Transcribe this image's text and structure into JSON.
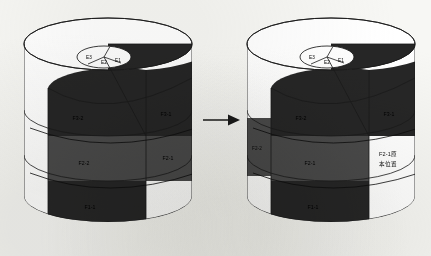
{
  "figure": {
    "background_color": "#f7f7f4",
    "transition_icon": "right-arrow-icon",
    "colors": {
      "dark_band": "#262626",
      "mid_band": "#4a4a4a",
      "empty_region": "#ffffff",
      "outline": "#1a1a1a",
      "paper": "#f7f7f4"
    }
  },
  "left_cylinder": {
    "name": "before-state",
    "top_sectors": [
      {
        "id": "E3",
        "label": "E3"
      },
      {
        "id": "E2",
        "label": "E2"
      },
      {
        "id": "E1",
        "label": "E1"
      }
    ],
    "bands": [
      {
        "id": "F3-2",
        "label": "F3-2",
        "column": "left",
        "row": "upper",
        "fill": "dark"
      },
      {
        "id": "F3-1",
        "label": "F3-1",
        "column": "right",
        "row": "upper",
        "fill": "dark"
      },
      {
        "id": "F2-2",
        "label": "F2-2",
        "column": "left",
        "row": "middle",
        "fill": "mid"
      },
      {
        "id": "F2-1",
        "label": "F2-1",
        "column": "right",
        "row": "middle",
        "fill": "mid"
      },
      {
        "id": "F1-1",
        "label": "F1-1",
        "column": "left",
        "row": "lower",
        "fill": "dark"
      }
    ]
  },
  "right_cylinder": {
    "name": "after-state",
    "top_sectors": [
      {
        "id": "E3",
        "label": "E3"
      },
      {
        "id": "E2",
        "label": "E2"
      },
      {
        "id": "E1",
        "label": "E1"
      }
    ],
    "bands": [
      {
        "id": "F3-2",
        "label": "F3-2",
        "column": "left",
        "row": "upper",
        "fill": "dark"
      },
      {
        "id": "F3-1",
        "label": "F3-1",
        "column": "right",
        "row": "upper",
        "fill": "dark"
      },
      {
        "id": "F2-2",
        "label": "F2-2",
        "column": "side",
        "row": "middle",
        "fill": "mid"
      },
      {
        "id": "F2-1",
        "label": "F2-1",
        "column": "left",
        "row": "middle",
        "fill": "mid"
      },
      {
        "id": "F1-1",
        "label": "F1-1",
        "column": "left",
        "row": "lower",
        "fill": "dark"
      }
    ],
    "vacated_region": {
      "id": "F2-1-original-position",
      "line1": "F2-1原",
      "line2": "本位置"
    }
  }
}
